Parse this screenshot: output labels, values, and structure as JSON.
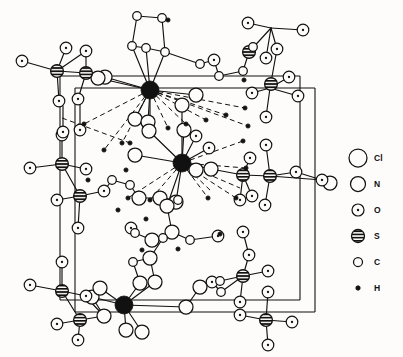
{
  "figure": {
    "background_color": "#fdfcfa",
    "line_color": "#111111"
  },
  "legend": {
    "entries": [
      {
        "label": "Cl",
        "symbol": "open-circle-large",
        "radius": 9.0,
        "style": "open",
        "fill": "#fdfcfa"
      },
      {
        "label": "N",
        "symbol": "open-circle-medium",
        "radius": 7.5,
        "style": "open",
        "fill": "#fdfcfa"
      },
      {
        "label": "O",
        "symbol": "dotted-circle",
        "radius": 6.0,
        "style": "dotted",
        "fill": "#fdfcfa"
      },
      {
        "label": "S",
        "symbol": "striped-circle",
        "radius": 6.5,
        "style": "striped",
        "fill": "#111111"
      },
      {
        "label": "C",
        "symbol": "open-circle-small",
        "radius": 4.5,
        "style": "open",
        "fill": "#fdfcfa"
      },
      {
        "label": "H",
        "symbol": "filled-dot",
        "radius": 2.2,
        "style": "filled",
        "fill": "#111111"
      }
    ],
    "x_symbol": 358,
    "x_label": 374,
    "y_start": 158,
    "y_step": 26
  },
  "cell": {
    "stroke_width": 1.1,
    "edges": [
      [
        60,
        76,
        300,
        76
      ],
      [
        60,
        76,
        60,
        300
      ],
      [
        60,
        300,
        300,
        300
      ],
      [
        300,
        76,
        300,
        300
      ],
      [
        75,
        88,
        315,
        88
      ],
      [
        75,
        88,
        75,
        312
      ],
      [
        75,
        312,
        315,
        312
      ],
      [
        315,
        88,
        315,
        312
      ]
    ]
  },
  "bonds": {
    "solid_width": 1.15,
    "dashed_width": 1.0,
    "dash_pattern": "5,3.5",
    "solid": [
      [
        57,
        71,
        22,
        61
      ],
      [
        57,
        71,
        66,
        48
      ],
      [
        57,
        71,
        86,
        51
      ],
      [
        57,
        71,
        59,
        101
      ],
      [
        86,
        51,
        86,
        73
      ],
      [
        86,
        73,
        57,
        71
      ],
      [
        86,
        73,
        78,
        99
      ],
      [
        86,
        73,
        105,
        77
      ],
      [
        86,
        73,
        98,
        78
      ],
      [
        150,
        90,
        98,
        78
      ],
      [
        150,
        90,
        105,
        77
      ],
      [
        150,
        90,
        132,
        46
      ],
      [
        150,
        90,
        146,
        48
      ],
      [
        150,
        90,
        165,
        52
      ],
      [
        150,
        90,
        196,
        95
      ],
      [
        150,
        90,
        135,
        119
      ],
      [
        150,
        90,
        148,
        122
      ],
      [
        137,
        16,
        162,
        18
      ],
      [
        137,
        16,
        132,
        46
      ],
      [
        162,
        18,
        165,
        52
      ],
      [
        132,
        46,
        146,
        48
      ],
      [
        146,
        48,
        165,
        52
      ],
      [
        165,
        52,
        200,
        64
      ],
      [
        200,
        64,
        214,
        60
      ],
      [
        214,
        60,
        219,
        76
      ],
      [
        219,
        76,
        243,
        71
      ],
      [
        243,
        71,
        249,
        52
      ],
      [
        249,
        52,
        253,
        47
      ],
      [
        249,
        52,
        271,
        28
      ],
      [
        271,
        28,
        248,
        23
      ],
      [
        271,
        28,
        277,
        49
      ],
      [
        271,
        28,
        303,
        30
      ],
      [
        271,
        28,
        266,
        58
      ],
      [
        277,
        49,
        270,
        88
      ],
      [
        270,
        88,
        289,
        77
      ],
      [
        270,
        88,
        252,
        93
      ],
      [
        270,
        88,
        266,
        117
      ],
      [
        270,
        88,
        298,
        96
      ],
      [
        62,
        164,
        30,
        168
      ],
      [
        62,
        164,
        62,
        135
      ],
      [
        62,
        164,
        86,
        169
      ],
      [
        62,
        164,
        80,
        196
      ],
      [
        80,
        196,
        57,
        200
      ],
      [
        80,
        196,
        78,
        228
      ],
      [
        80,
        196,
        104,
        191
      ],
      [
        104,
        191,
        112,
        180
      ],
      [
        112,
        180,
        130,
        185
      ],
      [
        130,
        185,
        139,
        198
      ],
      [
        139,
        198,
        160,
        198
      ],
      [
        160,
        198,
        167,
        206
      ],
      [
        167,
        206,
        182,
        163
      ],
      [
        182,
        163,
        135,
        155
      ],
      [
        182,
        163,
        149,
        131
      ],
      [
        182,
        163,
        184,
        130
      ],
      [
        182,
        163,
        196,
        136
      ],
      [
        182,
        163,
        196,
        170
      ],
      [
        182,
        163,
        176,
        202
      ],
      [
        182,
        163,
        211,
        169
      ],
      [
        182,
        163,
        209,
        148
      ],
      [
        211,
        169,
        243,
        175
      ],
      [
        243,
        175,
        250,
        158
      ],
      [
        243,
        175,
        252,
        196
      ],
      [
        243,
        175,
        270,
        176
      ],
      [
        243,
        175,
        240,
        200
      ],
      [
        270,
        176,
        296,
        172
      ],
      [
        270,
        176,
        266,
        145
      ],
      [
        270,
        176,
        322,
        180
      ],
      [
        270,
        176,
        265,
        205
      ],
      [
        296,
        172,
        322,
        180
      ],
      [
        167,
        206,
        172,
        232
      ],
      [
        172,
        232,
        152,
        240
      ],
      [
        152,
        240,
        135,
        233
      ],
      [
        135,
        233,
        131,
        228
      ],
      [
        172,
        232,
        190,
        240
      ],
      [
        190,
        240,
        218,
        236
      ],
      [
        160,
        198,
        178,
        200
      ],
      [
        150,
        258,
        163,
        238
      ],
      [
        150,
        258,
        133,
        262
      ],
      [
        163,
        238,
        152,
        240
      ],
      [
        133,
        262,
        140,
        283
      ],
      [
        150,
        258,
        155,
        282
      ],
      [
        124,
        305,
        92,
        297
      ],
      [
        124,
        305,
        100,
        288
      ],
      [
        124,
        305,
        140,
        283
      ],
      [
        124,
        305,
        155,
        282
      ],
      [
        124,
        305,
        126,
        330
      ],
      [
        124,
        305,
        142,
        332
      ],
      [
        124,
        305,
        186,
        307
      ],
      [
        186,
        307,
        200,
        287
      ],
      [
        200,
        287,
        212,
        282
      ],
      [
        212,
        282,
        221,
        292
      ],
      [
        221,
        292,
        243,
        276
      ],
      [
        243,
        276,
        249,
        255
      ],
      [
        243,
        276,
        268,
        271
      ],
      [
        243,
        276,
        240,
        302
      ],
      [
        243,
        276,
        220,
        281
      ],
      [
        249,
        255,
        243,
        232
      ],
      [
        62,
        291,
        30,
        285
      ],
      [
        62,
        291,
        62,
        262
      ],
      [
        62,
        291,
        86,
        296
      ],
      [
        62,
        291,
        80,
        320
      ],
      [
        80,
        320,
        57,
        324
      ],
      [
        80,
        320,
        78,
        340
      ],
      [
        80,
        320,
        104,
        316
      ],
      [
        104,
        316,
        92,
        297
      ],
      [
        85,
        296,
        104,
        316
      ],
      [
        266,
        320,
        240,
        315
      ],
      [
        266,
        320,
        268,
        292
      ],
      [
        266,
        320,
        292,
        322
      ],
      [
        266,
        320,
        268,
        345
      ],
      [
        63,
        106,
        63,
        132
      ],
      [
        80,
        103,
        80,
        130
      ],
      [
        182,
        105,
        182,
        163
      ],
      [
        150,
        90,
        150,
        122
      ]
    ],
    "dashed": [
      [
        150,
        90,
        84,
        124
      ],
      [
        150,
        90,
        104,
        150
      ],
      [
        150,
        90,
        122,
        143
      ],
      [
        150,
        90,
        168,
        128
      ],
      [
        150,
        90,
        186,
        124
      ],
      [
        150,
        90,
        206,
        120
      ],
      [
        150,
        90,
        226,
        115
      ],
      [
        150,
        90,
        245,
        108
      ],
      [
        150,
        90,
        248,
        126
      ],
      [
        182,
        163,
        128,
        198
      ],
      [
        182,
        163,
        150,
        200
      ],
      [
        182,
        163,
        208,
        198
      ],
      [
        182,
        163,
        236,
        198
      ],
      [
        182,
        163,
        246,
        168
      ],
      [
        182,
        163,
        243,
        141
      ],
      [
        182,
        163,
        240,
        188
      ],
      [
        182,
        163,
        212,
        192
      ],
      [
        62,
        118,
        130,
        143
      ]
    ]
  },
  "atoms": [
    {
      "t": "Cl",
      "x": 150,
      "y": 90
    },
    {
      "t": "Cl",
      "x": 182,
      "y": 163
    },
    {
      "t": "Cl",
      "x": 124,
      "y": 305
    },
    {
      "t": "S",
      "x": 57,
      "y": 71
    },
    {
      "t": "S",
      "x": 86,
      "y": 73
    },
    {
      "t": "S",
      "x": 249,
      "y": 52
    },
    {
      "t": "S",
      "x": 271,
      "y": 84
    },
    {
      "t": "S",
      "x": 62,
      "y": 164
    },
    {
      "t": "S",
      "x": 80,
      "y": 196
    },
    {
      "t": "S",
      "x": 243,
      "y": 175
    },
    {
      "t": "S",
      "x": 270,
      "y": 176
    },
    {
      "t": "S",
      "x": 62,
      "y": 291
    },
    {
      "t": "S",
      "x": 80,
      "y": 320
    },
    {
      "t": "S",
      "x": 243,
      "y": 276
    },
    {
      "t": "S",
      "x": 266,
      "y": 320
    },
    {
      "t": "O",
      "x": 22,
      "y": 61
    },
    {
      "t": "O",
      "x": 66,
      "y": 48
    },
    {
      "t": "O",
      "x": 86,
      "y": 51
    },
    {
      "t": "O",
      "x": 59,
      "y": 101
    },
    {
      "t": "O",
      "x": 78,
      "y": 99
    },
    {
      "t": "O",
      "x": 248,
      "y": 23
    },
    {
      "t": "O",
      "x": 277,
      "y": 49
    },
    {
      "t": "O",
      "x": 303,
      "y": 30
    },
    {
      "t": "O",
      "x": 266,
      "y": 58
    },
    {
      "t": "O",
      "x": 289,
      "y": 77
    },
    {
      "t": "O",
      "x": 252,
      "y": 93
    },
    {
      "t": "O",
      "x": 266,
      "y": 117
    },
    {
      "t": "O",
      "x": 298,
      "y": 96
    },
    {
      "t": "O",
      "x": 30,
      "y": 168
    },
    {
      "t": "O",
      "x": 62,
      "y": 135
    },
    {
      "t": "O",
      "x": 86,
      "y": 169
    },
    {
      "t": "O",
      "x": 57,
      "y": 200
    },
    {
      "t": "O",
      "x": 78,
      "y": 228
    },
    {
      "t": "O",
      "x": 250,
      "y": 158
    },
    {
      "t": "O",
      "x": 252,
      "y": 196
    },
    {
      "t": "O",
      "x": 266,
      "y": 145
    },
    {
      "t": "O",
      "x": 296,
      "y": 172
    },
    {
      "t": "O",
      "x": 322,
      "y": 180
    },
    {
      "t": "O",
      "x": 265,
      "y": 205
    },
    {
      "t": "O",
      "x": 240,
      "y": 200
    },
    {
      "t": "O",
      "x": 209,
      "y": 148
    },
    {
      "t": "O",
      "x": 30,
      "y": 285
    },
    {
      "t": "O",
      "x": 62,
      "y": 262
    },
    {
      "t": "O",
      "x": 86,
      "y": 296
    },
    {
      "t": "O",
      "x": 57,
      "y": 324
    },
    {
      "t": "O",
      "x": 78,
      "y": 340
    },
    {
      "t": "O",
      "x": 249,
      "y": 255
    },
    {
      "t": "O",
      "x": 268,
      "y": 271
    },
    {
      "t": "O",
      "x": 240,
      "y": 302
    },
    {
      "t": "O",
      "x": 240,
      "y": 315
    },
    {
      "t": "O",
      "x": 268,
      "y": 292
    },
    {
      "t": "O",
      "x": 292,
      "y": 322
    },
    {
      "t": "O",
      "x": 268,
      "y": 345
    },
    {
      "t": "O",
      "x": 243,
      "y": 232
    },
    {
      "t": "O",
      "x": 214,
      "y": 60
    },
    {
      "t": "O",
      "x": 196,
      "y": 136
    },
    {
      "t": "O",
      "x": 63,
      "y": 132
    },
    {
      "t": "O",
      "x": 80,
      "y": 130
    },
    {
      "t": "O",
      "x": 104,
      "y": 191
    },
    {
      "t": "O",
      "x": 218,
      "y": 236
    },
    {
      "t": "O",
      "x": 131,
      "y": 228
    },
    {
      "t": "O",
      "x": 212,
      "y": 282
    },
    {
      "t": "N",
      "x": 135,
      "y": 119
    },
    {
      "t": "N",
      "x": 148,
      "y": 122
    },
    {
      "t": "N",
      "x": 196,
      "y": 95
    },
    {
      "t": "N",
      "x": 105,
      "y": 77
    },
    {
      "t": "N",
      "x": 98,
      "y": 78
    },
    {
      "t": "N",
      "x": 135,
      "y": 155
    },
    {
      "t": "N",
      "x": 149,
      "y": 131
    },
    {
      "t": "N",
      "x": 184,
      "y": 130
    },
    {
      "t": "N",
      "x": 196,
      "y": 170
    },
    {
      "t": "N",
      "x": 176,
      "y": 202
    },
    {
      "t": "N",
      "x": 211,
      "y": 169
    },
    {
      "t": "N",
      "x": 160,
      "y": 198
    },
    {
      "t": "N",
      "x": 139,
      "y": 198
    },
    {
      "t": "N",
      "x": 92,
      "y": 297
    },
    {
      "t": "N",
      "x": 100,
      "y": 288
    },
    {
      "t": "N",
      "x": 186,
      "y": 307
    },
    {
      "t": "N",
      "x": 126,
      "y": 330
    },
    {
      "t": "N",
      "x": 142,
      "y": 332
    },
    {
      "t": "N",
      "x": 140,
      "y": 283
    },
    {
      "t": "N",
      "x": 155,
      "y": 282
    },
    {
      "t": "N",
      "x": 172,
      "y": 232
    },
    {
      "t": "N",
      "x": 152,
      "y": 240
    },
    {
      "t": "N",
      "x": 150,
      "y": 258
    },
    {
      "t": "N",
      "x": 200,
      "y": 287
    },
    {
      "t": "N",
      "x": 104,
      "y": 316
    },
    {
      "t": "N",
      "x": 330,
      "y": 183
    },
    {
      "t": "N",
      "x": 167,
      "y": 206
    },
    {
      "t": "N",
      "x": 182,
      "y": 105
    },
    {
      "t": "C",
      "x": 137,
      "y": 16
    },
    {
      "t": "C",
      "x": 162,
      "y": 18
    },
    {
      "t": "C",
      "x": 132,
      "y": 46
    },
    {
      "t": "C",
      "x": 146,
      "y": 48
    },
    {
      "t": "C",
      "x": 165,
      "y": 52
    },
    {
      "t": "C",
      "x": 200,
      "y": 64
    },
    {
      "t": "C",
      "x": 219,
      "y": 76
    },
    {
      "t": "C",
      "x": 243,
      "y": 71
    },
    {
      "t": "C",
      "x": 253,
      "y": 47
    },
    {
      "t": "C",
      "x": 112,
      "y": 180
    },
    {
      "t": "C",
      "x": 130,
      "y": 185
    },
    {
      "t": "C",
      "x": 163,
      "y": 238
    },
    {
      "t": "C",
      "x": 133,
      "y": 262
    },
    {
      "t": "C",
      "x": 135,
      "y": 233
    },
    {
      "t": "C",
      "x": 190,
      "y": 240
    },
    {
      "t": "C",
      "x": 221,
      "y": 292
    },
    {
      "t": "C",
      "x": 178,
      "y": 200
    },
    {
      "t": "C",
      "x": 220,
      "y": 281
    },
    {
      "t": "H",
      "x": 84,
      "y": 124
    },
    {
      "t": "H",
      "x": 104,
      "y": 150
    },
    {
      "t": "H",
      "x": 122,
      "y": 143
    },
    {
      "t": "H",
      "x": 168,
      "y": 128
    },
    {
      "t": "H",
      "x": 186,
      "y": 124
    },
    {
      "t": "H",
      "x": 206,
      "y": 120
    },
    {
      "t": "H",
      "x": 226,
      "y": 115
    },
    {
      "t": "H",
      "x": 245,
      "y": 108
    },
    {
      "t": "H",
      "x": 248,
      "y": 126
    },
    {
      "t": "H",
      "x": 128,
      "y": 198
    },
    {
      "t": "H",
      "x": 150,
      "y": 200
    },
    {
      "t": "H",
      "x": 208,
      "y": 198
    },
    {
      "t": "H",
      "x": 236,
      "y": 198
    },
    {
      "t": "H",
      "x": 246,
      "y": 168
    },
    {
      "t": "H",
      "x": 243,
      "y": 141
    },
    {
      "t": "H",
      "x": 130,
      "y": 143
    },
    {
      "t": "H",
      "x": 88,
      "y": 180
    },
    {
      "t": "H",
      "x": 126,
      "y": 170
    },
    {
      "t": "H",
      "x": 118,
      "y": 210
    },
    {
      "t": "H",
      "x": 146,
      "y": 219
    },
    {
      "t": "H",
      "x": 220,
      "y": 234
    },
    {
      "t": "H",
      "x": 178,
      "y": 249
    },
    {
      "t": "H",
      "x": 142,
      "y": 250
    },
    {
      "t": "H",
      "x": 168,
      "y": 20
    },
    {
      "t": "H",
      "x": 244,
      "y": 80
    }
  ],
  "atom_styles": {
    "Cl": {
      "radius": 9.0,
      "style": "filled-black"
    },
    "N": {
      "radius": 7.0,
      "style": "open"
    },
    "O": {
      "radius": 5.8,
      "style": "dotted"
    },
    "S": {
      "radius": 6.4,
      "style": "striped"
    },
    "C": {
      "radius": 4.3,
      "style": "open"
    },
    "H": {
      "radius": 2.1,
      "style": "filled"
    }
  }
}
